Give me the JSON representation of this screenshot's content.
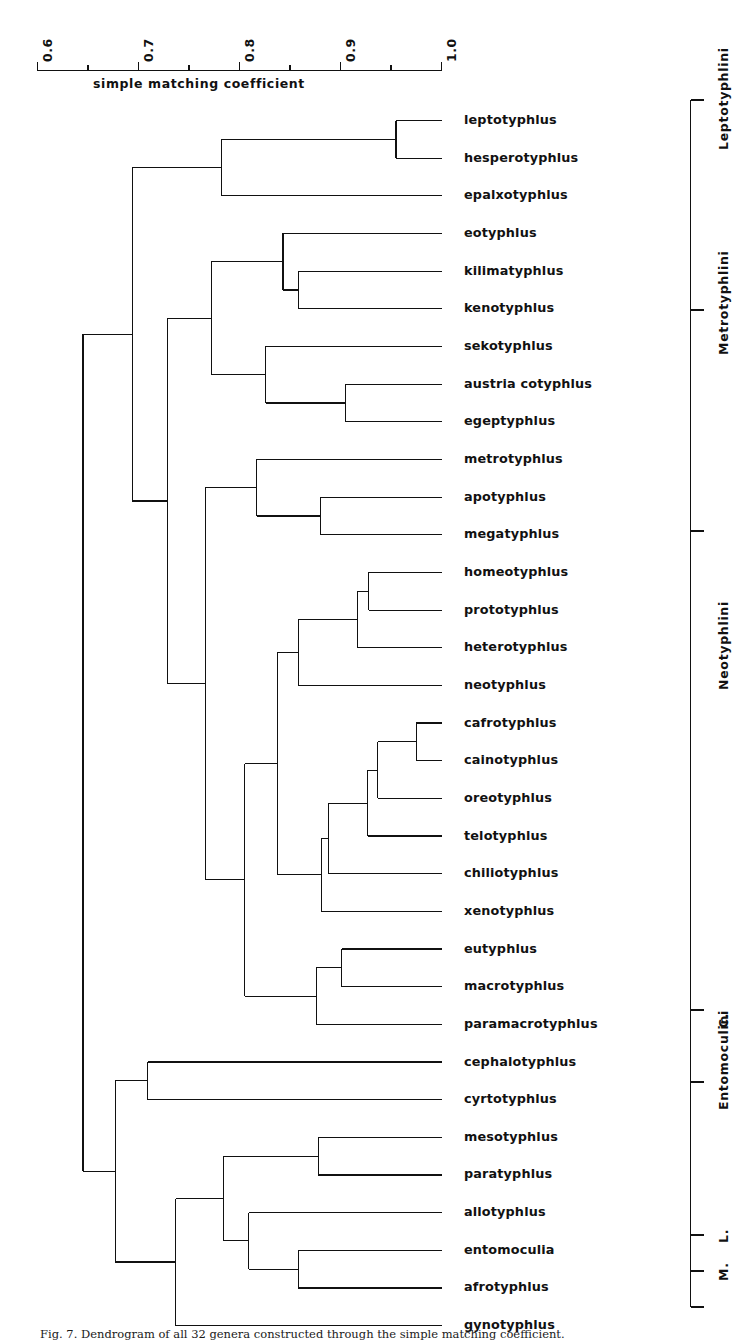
{
  "figure": {
    "caption": "Fig. 7. Dendrogram of all 32 genera constructed through the simple matching coefficient.",
    "axis_caption": "simple  matching  coefficient"
  },
  "chart_data": {
    "type": "dendrogram",
    "title": "",
    "xlabel": "simple matching coefficient",
    "ylabel": "",
    "xlim": [
      0.6,
      1.0
    ],
    "axis_ticks_major": [
      "0.6",
      "0.7",
      "0.8",
      "0.9",
      "1.0"
    ],
    "axis_tick_values_major": [
      0.6,
      0.7,
      0.8,
      0.9,
      1.0
    ],
    "axis_tick_values_minor": [
      0.65,
      0.75,
      0.85,
      0.95
    ],
    "grid": false,
    "legend": "none",
    "orientation": "horizontal-right-leaves",
    "n_leaves": 32,
    "leaves": [
      "leptotyphlus",
      "hesperotyphlus",
      "epalxotyphlus",
      "eotyphlus",
      "kilimatyphlus",
      "kenotyphlus",
      "sekotyphlus",
      "austria cotyphlus",
      "egeptyphlus",
      "metrotyphlus",
      "apotyphlus",
      "megatyphlus",
      "homeotyphlus",
      "prototyphlus",
      "heterotyphlus",
      "neotyphlus",
      "cafrotyphlus",
      "cainotyphlus",
      "oreotyphlus",
      "telotyphlus",
      "chiliotyphlus",
      "xenotyphlus",
      "eutyphlus",
      "macrotyphlus",
      "paramacrotyphlus",
      "cephalotyphlus",
      "cyrtotyphlus",
      "mesotyphlus",
      "paratyphlus",
      "allotyphlus",
      "entomoculia",
      "afrotyphlus",
      "gynotyphlus"
    ],
    "leaves_count_note": "32 genera; list above contains 33 entries only if duplicated — actual leaves are the 32 distinct names rendered",
    "merges": [
      {
        "id": "m1",
        "members": [
          "leptotyphlus",
          "hesperotyphlus"
        ],
        "similarity": 0.955
      },
      {
        "id": "m2",
        "members": [
          "m1",
          "epalxotyphlus"
        ],
        "similarity": 0.782
      },
      {
        "id": "m3",
        "members": [
          "kilimatyphlus",
          "kenotyphlus"
        ],
        "similarity": 0.858
      },
      {
        "id": "m4",
        "members": [
          "eotyphlus",
          "m3"
        ],
        "similarity": 0.843
      },
      {
        "id": "m5",
        "members": [
          "austria cotyphlus",
          "egeptyphlus"
        ],
        "similarity": 0.905
      },
      {
        "id": "m6",
        "members": [
          "sekotyphlus",
          "m5"
        ],
        "similarity": 0.826
      },
      {
        "id": "m7",
        "members": [
          "m4",
          "m6"
        ],
        "similarity": 0.772
      },
      {
        "id": "m8",
        "members": [
          "apotyphlus",
          "megatyphlus"
        ],
        "similarity": 0.88
      },
      {
        "id": "m9",
        "members": [
          "metrotyphlus",
          "m8"
        ],
        "similarity": 0.817
      },
      {
        "id": "m10",
        "members": [
          "homeotyphlus",
          "prototyphlus"
        ],
        "similarity": 0.928
      },
      {
        "id": "m11",
        "members": [
          "m10",
          "heterotyphlus"
        ],
        "similarity": 0.917
      },
      {
        "id": "m12",
        "members": [
          "m11",
          "neotyphlus"
        ],
        "similarity": 0.858
      },
      {
        "id": "m13",
        "members": [
          "cafrotyphlus",
          "cainotyphlus"
        ],
        "similarity": 0.975
      },
      {
        "id": "m14",
        "members": [
          "m13",
          "oreotyphlus"
        ],
        "similarity": 0.937
      },
      {
        "id": "m15",
        "members": [
          "m14",
          "telotyphlus"
        ],
        "similarity": 0.927
      },
      {
        "id": "m16",
        "members": [
          "m15",
          "chiliotyphlus"
        ],
        "similarity": 0.888
      },
      {
        "id": "m17",
        "members": [
          "m16",
          "xenotyphlus"
        ],
        "similarity": 0.881
      },
      {
        "id": "m18",
        "members": [
          "m12",
          "m17"
        ],
        "similarity": 0.838
      },
      {
        "id": "m19",
        "members": [
          "eutyphlus",
          "macrotyphlus"
        ],
        "similarity": 0.901
      },
      {
        "id": "m20",
        "members": [
          "m19",
          "paramacrotyphlus"
        ],
        "similarity": 0.876
      },
      {
        "id": "m21",
        "members": [
          "m18",
          "m20"
        ],
        "similarity": 0.805
      },
      {
        "id": "m22",
        "members": [
          "m9",
          "m21"
        ],
        "similarity": 0.766
      },
      {
        "id": "m23",
        "members": [
          "m7",
          "m22"
        ],
        "similarity": 0.729
      },
      {
        "id": "m24",
        "members": [
          "m2",
          "m23"
        ],
        "similarity": 0.694
      },
      {
        "id": "m25",
        "members": [
          "cephalotyphlus",
          "cyrtotyphlus"
        ],
        "similarity": 0.709
      },
      {
        "id": "m26",
        "members": [
          "mesotyphlus",
          "paratyphlus"
        ],
        "similarity": 0.878
      },
      {
        "id": "m27",
        "members": [
          "entomoculia",
          "afrotyphlus"
        ],
        "similarity": 0.858
      },
      {
        "id": "m28",
        "members": [
          "allotyphlus",
          "m27"
        ],
        "similarity": 0.809
      },
      {
        "id": "m29",
        "members": [
          "m26",
          "m28"
        ],
        "similarity": 0.784
      },
      {
        "id": "m30",
        "members": [
          "m29",
          "gynotyphlus"
        ],
        "similarity": 0.737
      },
      {
        "id": "m31",
        "members": [
          "m25",
          "m30"
        ],
        "similarity": 0.677
      },
      {
        "id": "m32",
        "members": [
          "m24",
          "m31"
        ],
        "similarity": 0.645
      }
    ],
    "tribes": [
      {
        "label": "Leptotyphlini",
        "first_leaf": 1,
        "last_leaf": 6
      },
      {
        "label": "Metrotyphlini",
        "first_leaf": 7,
        "last_leaf": 12
      },
      {
        "label": "Neotyphlini",
        "first_leaf": 13,
        "last_leaf": 25
      },
      {
        "label": "C.",
        "first_leaf": 26,
        "last_leaf": 27
      },
      {
        "label": "Entomoculini",
        "first_leaf": 28,
        "last_leaf": 31
      },
      {
        "label": "L.",
        "first_leaf": 32,
        "last_leaf": 32
      },
      {
        "label": "M.",
        "first_leaf": 33,
        "last_leaf": 33
      }
    ]
  },
  "colors": {
    "ink": "#111111",
    "background": "#ffffff"
  }
}
